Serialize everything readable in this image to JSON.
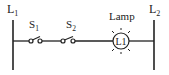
{
  "diagram": {
    "type": "ladder-logic-rung",
    "rails": {
      "left": {
        "label": "L",
        "subscript": "1"
      },
      "right": {
        "label": "L",
        "subscript": "2"
      }
    },
    "switches": [
      {
        "label": "S",
        "subscript": "1",
        "type": "normally-open"
      },
      {
        "label": "S",
        "subscript": "2",
        "type": "normally-open"
      }
    ],
    "lamp": {
      "label": "Lamp",
      "inner_label": "L1"
    },
    "colors": {
      "line": "#222222",
      "background": "#ffffff"
    }
  }
}
